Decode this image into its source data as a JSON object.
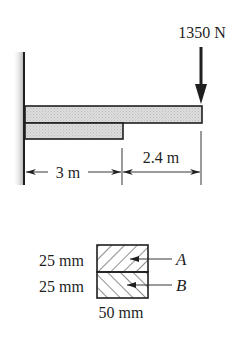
{
  "figure": {
    "type": "cantilever-composite-beam",
    "load": {
      "label": "1350 N",
      "direction": "down"
    },
    "dimensions": {
      "left_span_label": "3 m",
      "right_span_label": "2.4 m"
    },
    "cross_section": {
      "top_height_label": "25 mm",
      "bottom_height_label": "25 mm",
      "width_label": "50 mm",
      "top_part_label": "A",
      "bottom_part_label": "B"
    },
    "colors": {
      "line": "#1f1f1f",
      "beam_fill": "#d9d9d9",
      "wall_shade": "#bdbdbd"
    }
  }
}
